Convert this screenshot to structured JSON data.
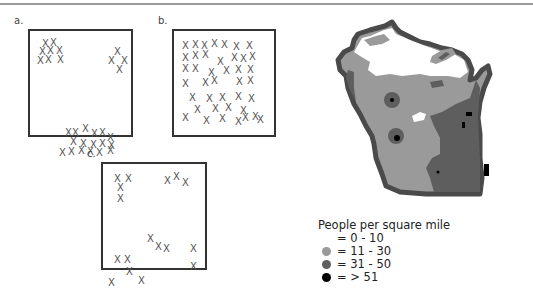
{
  "panels": [
    {
      "label": "a.",
      "pattern": "clustered",
      "box": {
        "x": 28,
        "y": 29,
        "w": 105,
        "h": 108
      },
      "points": [
        [
          12,
          8
        ],
        [
          20,
          7
        ],
        [
          9,
          16
        ],
        [
          17,
          15
        ],
        [
          26,
          15
        ],
        [
          7,
          25
        ],
        [
          15,
          24
        ],
        [
          27,
          24
        ],
        [
          84,
          16
        ],
        [
          78,
          25
        ],
        [
          91,
          25
        ],
        [
          86,
          34
        ],
        [
          35,
          97
        ],
        [
          42,
          97
        ],
        [
          52,
          93
        ],
        [
          61,
          98
        ],
        [
          69,
          97
        ],
        [
          77,
          102
        ],
        [
          40,
          106
        ],
        [
          50,
          108
        ],
        [
          60,
          109
        ],
        [
          69,
          108
        ],
        [
          78,
          110
        ],
        [
          29,
          117
        ],
        [
          38,
          116
        ],
        [
          48,
          115
        ],
        [
          57,
          116
        ],
        [
          66,
          117
        ],
        [
          77,
          115
        ]
      ]
    },
    {
      "label": "b.",
      "pattern": "uniform",
      "box": {
        "x": 172,
        "y": 29,
        "w": 104,
        "h": 108
      },
      "points": [
        [
          8,
          10
        ],
        [
          18,
          9
        ],
        [
          27,
          10
        ],
        [
          37,
          8
        ],
        [
          47,
          9
        ],
        [
          59,
          11
        ],
        [
          72,
          10
        ],
        [
          8,
          22
        ],
        [
          18,
          20
        ],
        [
          28,
          19
        ],
        [
          43,
          26
        ],
        [
          57,
          22
        ],
        [
          66,
          23
        ],
        [
          75,
          21
        ],
        [
          8,
          33
        ],
        [
          18,
          33
        ],
        [
          34,
          37
        ],
        [
          49,
          35
        ],
        [
          61,
          34
        ],
        [
          73,
          34
        ],
        [
          8,
          48
        ],
        [
          28,
          47
        ],
        [
          37,
          45
        ],
        [
          62,
          46
        ],
        [
          73,
          45
        ],
        [
          15,
          62
        ],
        [
          32,
          63
        ],
        [
          45,
          62
        ],
        [
          61,
          61
        ],
        [
          74,
          63
        ],
        [
          20,
          74
        ],
        [
          38,
          73
        ],
        [
          51,
          72
        ],
        [
          66,
          75
        ],
        [
          8,
          82
        ],
        [
          29,
          85
        ],
        [
          45,
          83
        ],
        [
          61,
          86
        ],
        [
          78,
          81
        ],
        [
          68,
          82
        ],
        [
          83,
          84
        ]
      ]
    },
    {
      "label": "c.",
      "pattern": "random",
      "box": {
        "x": 101,
        "y": 162,
        "w": 106,
        "h": 108
      },
      "points": [
        [
          11,
          10
        ],
        [
          22,
          10
        ],
        [
          14,
          19
        ],
        [
          14,
          30
        ],
        [
          61,
          12
        ],
        [
          70,
          8
        ],
        [
          79,
          14
        ],
        [
          44,
          70
        ],
        [
          52,
          78
        ],
        [
          60,
          80
        ],
        [
          87,
          80
        ],
        [
          11,
          91
        ],
        [
          21,
          91
        ],
        [
          23,
          103
        ],
        [
          87,
          98
        ],
        [
          5,
          114
        ],
        [
          35,
          112
        ]
      ]
    }
  ],
  "x_glyph": "X",
  "map": {
    "region": "Wisconsin",
    "colors": {
      "outline": "#4a4a4a",
      "level_0_10": "#ffffff",
      "level_11_30": "#9a9a9a",
      "level_31_50": "#5e5e5e",
      "level_51_plus": "#000000"
    }
  },
  "legend": {
    "title": "People per square mile",
    "items": [
      {
        "label": "= 0 - 10",
        "color": "#ffffff"
      },
      {
        "label": "= 11 - 30",
        "color": "#9a9a9a"
      },
      {
        "label": "= 31 - 50",
        "color": "#5e5e5e"
      },
      {
        "label": "= > 51",
        "color": "#000000"
      }
    ]
  }
}
